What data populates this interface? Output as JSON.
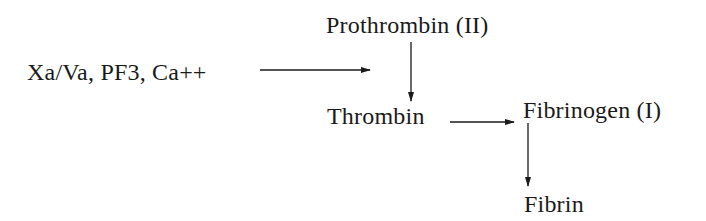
{
  "diagram": {
    "type": "flow",
    "title": "",
    "nodes": {
      "cofactors": {
        "label": "Xa/Va, PF3, Ca++"
      },
      "prothrombin": {
        "label": "Prothrombin (II)"
      },
      "thrombin": {
        "label": "Thrombin"
      },
      "fibrinogen": {
        "label": "Fibrinogen (I)"
      },
      "fibrin": {
        "label": "Fibrin"
      }
    },
    "edges": [
      {
        "from": "cofactors",
        "to": "prothrombin-thrombin-conversion",
        "direction": "right"
      },
      {
        "from": "prothrombin",
        "to": "thrombin",
        "direction": "down"
      },
      {
        "from": "thrombin",
        "to": "fibrinogen",
        "direction": "right"
      },
      {
        "from": "fibrinogen",
        "to": "fibrin",
        "direction": "down"
      }
    ],
    "colors": {
      "text": "#1a1a1a",
      "arrow": "#1a1a1a",
      "background": "#ffffff"
    }
  }
}
